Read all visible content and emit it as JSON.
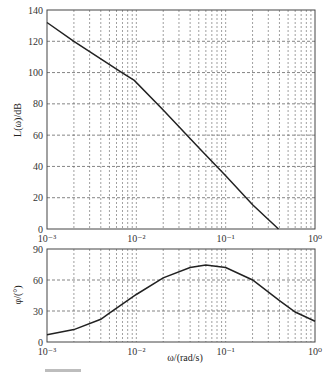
{
  "chart_data": [
    {
      "type": "line",
      "title": "",
      "xlabel": "",
      "ylabel": "L(ω)/dB",
      "xscale": "log",
      "xlim": [
        0.001,
        1
      ],
      "ylim": [
        0,
        140
      ],
      "grid": true,
      "x_tick_labels": [
        "10⁻³",
        "10⁻²",
        "10⁻¹",
        "10⁰"
      ],
      "y_ticks": [
        0,
        20,
        40,
        60,
        80,
        100,
        120,
        140
      ],
      "series": [
        {
          "name": "magnitude",
          "x": [
            0.001,
            0.002,
            0.0069,
            0.0095,
            0.02,
            0.05,
            0.1,
            0.2,
            0.39
          ],
          "values": [
            132,
            120,
            100,
            95,
            76,
            52,
            34,
            15.5,
            0
          ]
        }
      ]
    },
    {
      "type": "line",
      "title": "",
      "xlabel": "ω/(rad/s)",
      "ylabel": "φ/(°)",
      "xscale": "log",
      "xlim": [
        0.001,
        1
      ],
      "ylim": [
        0,
        90
      ],
      "grid": true,
      "x_tick_labels": [
        "10⁻³",
        "10⁻²",
        "10⁻¹",
        "10⁰"
      ],
      "y_ticks": [
        0,
        30,
        60,
        90
      ],
      "series": [
        {
          "name": "phase",
          "x": [
            0.001,
            0.002,
            0.004,
            0.005,
            0.01,
            0.02,
            0.04,
            0.06,
            0.1,
            0.2,
            0.4,
            0.6,
            1.0
          ],
          "values": [
            7,
            12,
            22,
            28,
            46,
            62,
            72,
            74.5,
            72,
            60,
            40,
            29,
            20
          ]
        }
      ]
    }
  ],
  "labels": {
    "mag_ylabel": "L(ω)/dB",
    "phase_ylabel": "φ/(°)",
    "xlabel": "ω/(rad/s)",
    "mag_yticks": [
      "140",
      "120",
      "100",
      "80",
      "60",
      "40",
      "20",
      "0"
    ],
    "phase_yticks": [
      "90",
      "60",
      "30",
      "0"
    ]
  }
}
